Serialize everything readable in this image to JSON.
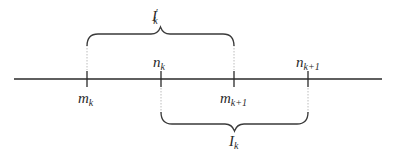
{
  "diagram": {
    "line_color": "#2a2a2a",
    "brace_color": "#3a3a3a",
    "number_line": {
      "x1": 14,
      "x2": 382,
      "y": 79
    },
    "ticks": [
      {
        "x": 87,
        "label_base": "m",
        "label_sub": "k",
        "position": "below"
      },
      {
        "x": 161,
        "label_base": "n",
        "label_sub": "k",
        "position": "above"
      },
      {
        "x": 234,
        "label_base": "m",
        "label_sub": "k+1",
        "position": "below"
      },
      {
        "x": 308,
        "label_base": "n",
        "label_sub": "k+1",
        "position": "above"
      }
    ],
    "braces": [
      {
        "name": "I-prime-k",
        "from": 87,
        "to": 234,
        "side": "top",
        "label_base": "I",
        "label_sup": "′",
        "label_sub": "k"
      },
      {
        "name": "I-k",
        "from": 161,
        "to": 308,
        "side": "bottom",
        "label_base": "I",
        "label_sup": "",
        "label_sub": "k"
      }
    ]
  }
}
